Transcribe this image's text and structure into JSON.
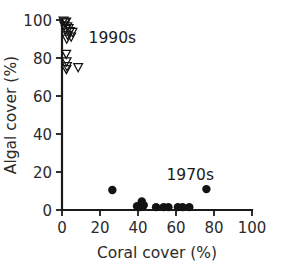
{
  "chart_data": {
    "type": "scatter",
    "title": "",
    "xlabel": "Coral cover (%)",
    "ylabel": "Algal cover (%)",
    "xlim": [
      0,
      100
    ],
    "ylim": [
      0,
      100
    ],
    "xticks": [
      0,
      20,
      40,
      60,
      80,
      100
    ],
    "yticks": [
      0,
      20,
      40,
      60,
      80,
      100
    ],
    "xtick_labels": [
      "0",
      "20",
      "40",
      "60",
      "80",
      "100"
    ],
    "ytick_labels": [
      "0",
      "20",
      "40",
      "60",
      "80",
      "100"
    ],
    "grid": false,
    "legend": "inline annotations",
    "annotations": [
      {
        "text": "1990s",
        "x": 14,
        "y": 88
      },
      {
        "text": "1970s",
        "x": 55,
        "y": 16
      }
    ],
    "series": [
      {
        "name": "1990s",
        "marker": "open-down-triangle",
        "color": "#131313",
        "filled": false,
        "points": [
          {
            "x": 0.8,
            "y": 99.5
          },
          {
            "x": 1.5,
            "y": 98.5
          },
          {
            "x": 2.2,
            "y": 99.0
          },
          {
            "x": 1.2,
            "y": 97.0
          },
          {
            "x": 2.8,
            "y": 96.5
          },
          {
            "x": 2.0,
            "y": 95.0
          },
          {
            "x": 3.5,
            "y": 95.5
          },
          {
            "x": 4.2,
            "y": 94.0
          },
          {
            "x": 5.5,
            "y": 93.5
          },
          {
            "x": 3.0,
            "y": 92.0
          },
          {
            "x": 4.8,
            "y": 91.0
          },
          {
            "x": 2.5,
            "y": 90.0
          },
          {
            "x": 2.2,
            "y": 82.0
          },
          {
            "x": 2.4,
            "y": 78.0
          },
          {
            "x": 2.6,
            "y": 75.5
          },
          {
            "x": 2.3,
            "y": 74.0
          },
          {
            "x": 8.5,
            "y": 75.0
          }
        ]
      },
      {
        "name": "1970s",
        "marker": "filled-circle",
        "color": "#131313",
        "filled": true,
        "points": [
          {
            "x": 26.5,
            "y": 10.5
          },
          {
            "x": 39.5,
            "y": 2.0
          },
          {
            "x": 41.0,
            "y": 1.5
          },
          {
            "x": 42.0,
            "y": 4.5
          },
          {
            "x": 43.0,
            "y": 2.5
          },
          {
            "x": 49.5,
            "y": 1.5
          },
          {
            "x": 53.5,
            "y": 1.5
          },
          {
            "x": 56.0,
            "y": 1.5
          },
          {
            "x": 61.0,
            "y": 1.5
          },
          {
            "x": 63.5,
            "y": 1.5
          },
          {
            "x": 67.0,
            "y": 1.5
          },
          {
            "x": 76.0,
            "y": 11.0
          }
        ]
      }
    ]
  }
}
